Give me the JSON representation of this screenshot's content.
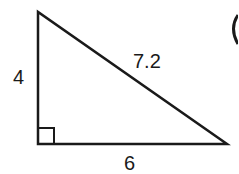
{
  "figure": {
    "type": "right-triangle",
    "right_angle_marker": true,
    "sides": {
      "vertical_leg": "4",
      "hypotenuse": "7.2",
      "horizontal_leg": "6"
    },
    "partial_glyph_right_edge": "("
  },
  "colors": {
    "stroke": "#1a1a1a",
    "background": "#ffffff"
  }
}
